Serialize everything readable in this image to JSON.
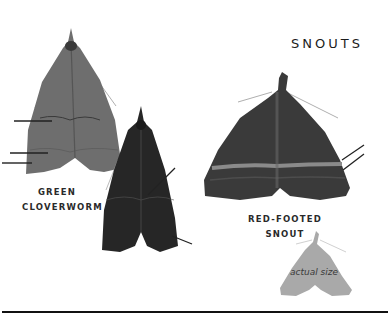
{
  "page": {
    "section_title": "SNOUTS",
    "colors": {
      "background": "#ffffff",
      "green_cloverworm_wing": "#6b6b6b",
      "dark_specimen_wing": "#2a2a2a",
      "red_footed_snout_wing": "#3c3c3c",
      "actual_size_silhouette": "#a9a9a9",
      "rule": "#111111"
    }
  },
  "specimens": [
    {
      "name": "green-cloverworm-light",
      "label_line1": "GREEN",
      "label_line2": "CLOVERWORM",
      "arrow_count": 3
    },
    {
      "name": "green-cloverworm-dark",
      "arrow_count": 2
    },
    {
      "name": "red-footed-snout",
      "label_line1": "RED-FOOTED",
      "label_line2": "SNOUT",
      "arrow_count": 2
    }
  ],
  "actual_size": {
    "label": "actual size"
  }
}
